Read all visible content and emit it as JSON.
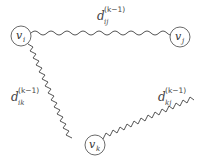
{
  "diagram": {
    "type": "graph-triangle",
    "colors": {
      "stroke": "#555555",
      "node_fill": "#ffffff",
      "text": "#333333"
    },
    "nodes": [
      {
        "id": "i",
        "label": "v",
        "subscript": "i",
        "cx": 21,
        "cy": 36,
        "r": 10
      },
      {
        "id": "j",
        "label": "v",
        "subscript": "j",
        "cx": 180,
        "cy": 37,
        "r": 10
      },
      {
        "id": "k",
        "label": "v",
        "subscript": "k",
        "cx": 95,
        "cy": 145,
        "r": 10
      }
    ],
    "edges": [
      {
        "from": "i",
        "to": "j",
        "label": {
          "main": "d",
          "subscript": "ij",
          "superscript": "(k−1)"
        }
      },
      {
        "from": "i",
        "to": "k",
        "label": {
          "main": "d",
          "subscript": "ik",
          "superscript": "(k−1)"
        }
      },
      {
        "from": "k",
        "to": "j",
        "label": {
          "main": "d",
          "subscript": "kj",
          "superscript": "(k−1)"
        }
      }
    ]
  }
}
